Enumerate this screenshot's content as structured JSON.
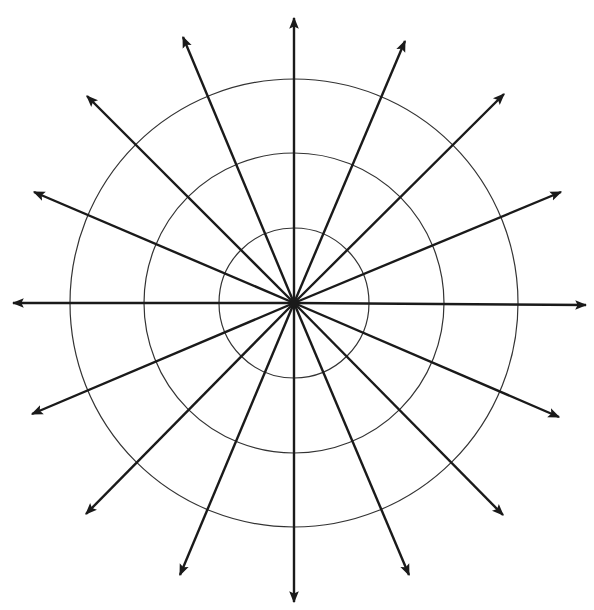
{
  "diagram": {
    "type": "polar-ray-diagram",
    "background": "#ffffff",
    "stroke_color": "#1a1a1a",
    "circle_color": "#333333",
    "center": [
      294,
      303
    ],
    "circles": [
      {
        "r": 75
      },
      {
        "r": 150
      },
      {
        "r": 224
      }
    ],
    "rays": [
      {
        "tip": [
          294,
          18
        ]
      },
      {
        "tip": [
          405,
          41
        ]
      },
      {
        "tip": [
          504,
          94
        ]
      },
      {
        "tip": [
          561,
          192
        ]
      },
      {
        "tip": [
          586,
          305
        ]
      },
      {
        "tip": [
          559,
          417
        ]
      },
      {
        "tip": [
          503,
          515
        ]
      },
      {
        "tip": [
          409,
          575
        ]
      },
      {
        "tip": [
          294,
          602
        ]
      },
      {
        "tip": [
          180,
          575
        ]
      },
      {
        "tip": [
          86,
          514
        ]
      },
      {
        "tip": [
          32,
          414
        ]
      },
      {
        "tip": [
          13,
          303
        ]
      },
      {
        "tip": [
          34,
          192
        ]
      },
      {
        "tip": [
          87,
          96
        ]
      },
      {
        "tip": [
          183,
          37
        ]
      }
    ]
  }
}
